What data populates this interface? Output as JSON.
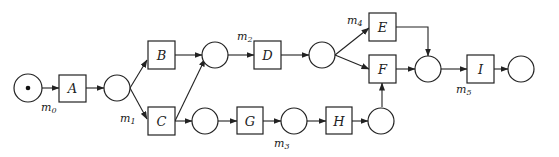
{
  "diagram": {
    "type": "petri-net",
    "transitions": [
      {
        "id": "A",
        "label": "A"
      },
      {
        "id": "B",
        "label": "B"
      },
      {
        "id": "C",
        "label": "C"
      },
      {
        "id": "D",
        "label": "D"
      },
      {
        "id": "E",
        "label": "E"
      },
      {
        "id": "F",
        "label": "F"
      },
      {
        "id": "G",
        "label": "G"
      },
      {
        "id": "H",
        "label": "H"
      },
      {
        "id": "I",
        "label": "I"
      }
    ],
    "markings": [
      {
        "id": "m0",
        "base": "m",
        "sub": "0"
      },
      {
        "id": "m1",
        "base": "m",
        "sub": "1"
      },
      {
        "id": "m2",
        "base": "m",
        "sub": "2"
      },
      {
        "id": "m3",
        "base": "m",
        "sub": "3"
      },
      {
        "id": "m4",
        "base": "m",
        "sub": "4"
      },
      {
        "id": "m5",
        "base": "m",
        "sub": "5"
      }
    ],
    "initial_token_place": "p0"
  }
}
